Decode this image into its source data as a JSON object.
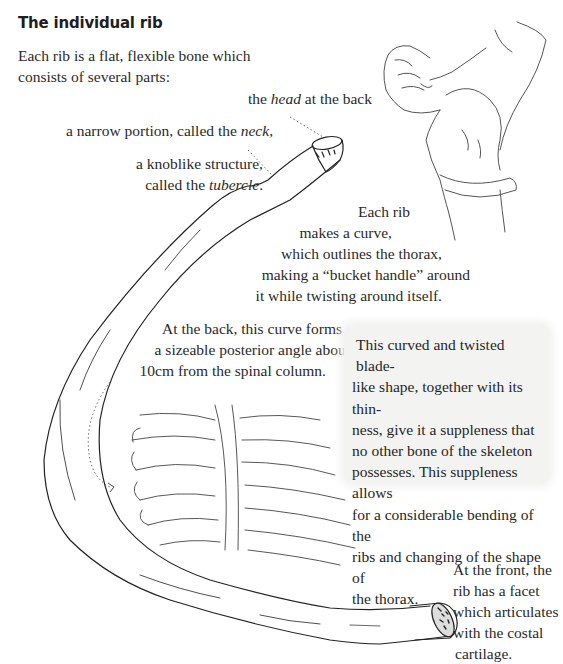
{
  "page": {
    "heading": "The individual rib",
    "intro": "Each rib is a flat, flexible bone which consists of several parts:",
    "labels": {
      "head": {
        "prefix": "the ",
        "term": "head",
        "suffix": " at the back"
      },
      "neck": {
        "prefix": "a narrow portion, called the ",
        "term": "neck",
        "suffix": ","
      },
      "tubercle": {
        "line1": "a knoblike structure,",
        "prefix": "called the ",
        "term": "tubercle",
        "suffix": "."
      },
      "curve": {
        "line1": "Each rib",
        "line2": "makes a curve,",
        "line3": "which outlines the thorax,",
        "line4": "making a “bucket handle” around",
        "line5": "it while twisting around itself."
      },
      "back_angle": {
        "line1": "At the back, this curve forms",
        "line2": "a sizeable posterior angle about",
        "line3": "10cm from the spinal column."
      },
      "front": {
        "line1": "At the front, the",
        "line2": "rib has a facet",
        "line3": "which articulates",
        "line4": "with the costal",
        "line5": "cartilage."
      }
    },
    "sidebar_box": {
      "text": "This curved and twisted blade-like shape, together with its thinness, give it a suppleness that no other bone of the skeleton possesses. This suppleness allows for a considerable bending of the ribs and changing of the shape of the thorax.",
      "lines": [
        "This curved and twisted blade-",
        "like shape, together with its thin-",
        "ness, give it a suppleness that",
        "no other bone of the skeleton",
        "possesses. This suppleness allows",
        "for a considerable bending of the",
        "ribs and changing of the shape of",
        "the thorax."
      ],
      "background": "#f3f3f2"
    },
    "illustrations": {
      "rib": "rib-drawing",
      "figure": "figure-arching-back-drawing",
      "spine": "thoracic-spine-drawing"
    },
    "colors": {
      "ink": "#2a2a2a",
      "line": "#333333"
    }
  }
}
